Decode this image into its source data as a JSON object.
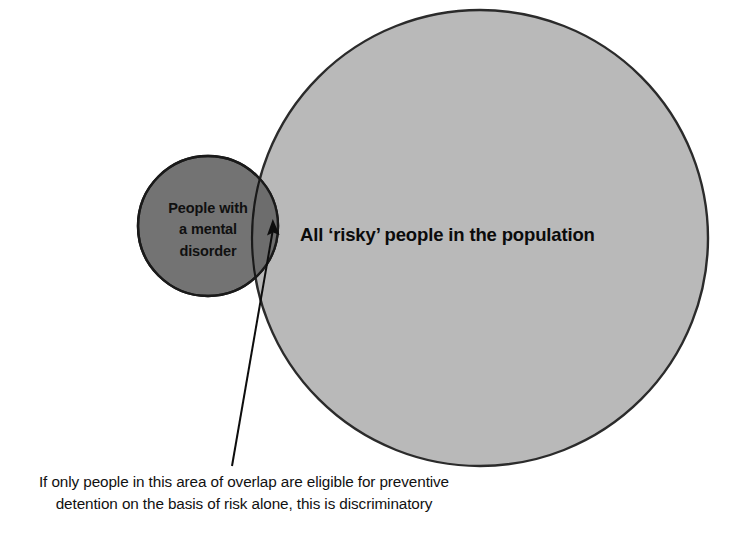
{
  "diagram": {
    "type": "venn-diagram",
    "background_color": "#ffffff",
    "sets": [
      {
        "id": "mental-disorder",
        "label_lines": [
          "People with",
          "a mental",
          "disorder"
        ],
        "fill_color": "#737373",
        "stroke_color": "#1a1a1a",
        "center_x": 208,
        "center_y": 226,
        "radius": 70
      },
      {
        "id": "risky-population",
        "label": "All ‘risky’ people in the population",
        "fill_color": "#b9b9b9",
        "stroke_color": "#2b2b2b",
        "center_x": 480,
        "center_y": 238,
        "radius": 228
      }
    ],
    "overlap": {
      "id": "overlap-region",
      "fill_color": "#6d6d6d",
      "description": "area of overlap"
    },
    "annotation": {
      "id": "overlap-callout",
      "arrow_color": "#0d0d0d",
      "arrow_tail_x": 232,
      "arrow_tail_y": 466,
      "arrow_head_x": 272,
      "arrow_head_y": 224,
      "caption_lines": [
        "If only people in this area of overlap are eligible for preventive",
        "detention on the basis of risk alone, this is discriminatory"
      ]
    }
  }
}
